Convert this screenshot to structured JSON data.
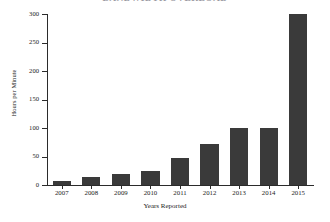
{
  "chart_data": {
    "type": "bar",
    "title": "BANDWIDTH OVERLOAD",
    "categories": [
      "2007",
      "2008",
      "2009",
      "2010",
      "2011",
      "2012",
      "2013",
      "2014",
      "2015"
    ],
    "values": [
      7,
      14,
      20,
      24,
      48,
      72,
      100,
      100,
      300
    ],
    "xlabel": "Years Reported",
    "ylabel": "Hours per Minute",
    "ylim": [
      0,
      300
    ],
    "yticks": [
      0,
      50,
      100,
      150,
      200,
      250,
      300
    ],
    "ytick_labels": [
      "0",
      "50",
      "100",
      "150",
      "200",
      "250",
      "300"
    ],
    "grid": false,
    "legend": null,
    "bar_color": "#3a3a3a",
    "background_color": "#ffffff",
    "axis_color": "#2b2b2b"
  }
}
